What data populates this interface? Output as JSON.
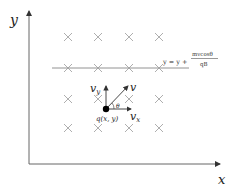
{
  "axes": {
    "x_label": "x",
    "y_label": "y"
  },
  "field": {
    "symbol": "×",
    "rows": [
      37,
      68,
      99,
      128
    ],
    "cols": [
      68,
      98,
      129,
      159
    ]
  },
  "line": {
    "equation_lhs": "y = y +",
    "numerator": "mvcosθ",
    "denominator": "qB"
  },
  "charge": {
    "label": "q(x, y)"
  },
  "vectors": {
    "v": "v",
    "vx": "v",
    "vx_sub": "x",
    "vy": "v",
    "vy_sub": "y",
    "angle": "θ"
  },
  "colors": {
    "axis": "#555555",
    "cross": "#999999",
    "line": "#777777",
    "text": "#222222"
  }
}
